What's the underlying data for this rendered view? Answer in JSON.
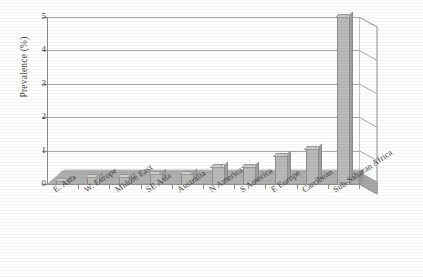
{
  "chart_data": {
    "type": "bar",
    "title": "",
    "xlabel": "",
    "ylabel": "Prevalence (%)",
    "ylim": [
      0,
      5
    ],
    "yticks": [
      "0",
      "1",
      "2",
      "3",
      "4",
      "5"
    ],
    "grid": true,
    "legend": "none",
    "style": "3d-perspective-bar",
    "categories": [
      "E. Asia",
      "W. Europe",
      "Middle East",
      "SE Asia",
      "Australia",
      "N America",
      "S America",
      "E Europe",
      "Carribean",
      "Sub-Saharan Africa"
    ],
    "values": [
      0.1,
      0.2,
      0.2,
      0.3,
      0.3,
      0.5,
      0.5,
      0.85,
      1.05,
      5.0
    ]
  },
  "colors": {
    "bar_face": "#b9b9b9",
    "bar_top": "#cdcdcd",
    "bar_side": "#9f9f9f",
    "floor": "#a8a8a8",
    "gridline": "#a9a9a9",
    "axis": "#8a8a8a",
    "text": "#3f3f3f"
  }
}
